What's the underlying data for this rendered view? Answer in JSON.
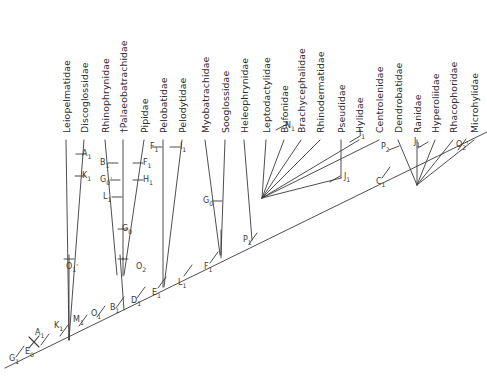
{
  "figure": {
    "type": "phylogenetic-tree",
    "title": ""
  },
  "taxa": [
    {
      "id": "leiopelmatidae",
      "label": "Leiopelmatidae",
      "x": 62,
      "y": 133,
      "tip_x": 66,
      "tip_y": 140
    },
    {
      "id": "discoglossidae",
      "label": "Discoglossidae",
      "x": 80,
      "y": 133,
      "tip_x": 84,
      "tip_y": 140
    },
    {
      "id": "rhinophrynidae",
      "label": "Rhinophrynidae",
      "x": 101,
      "y": 133,
      "tip_x": 105,
      "tip_y": 140
    },
    {
      "id": "palaeobatrachidae",
      "label": "†Palaeobatrachidae",
      "x": 119,
      "y": 133,
      "tip_x": 123,
      "tip_y": 140
    },
    {
      "id": "pipidae",
      "label": "Pipidae",
      "x": 140,
      "y": 133,
      "tip_x": 144,
      "tip_y": 140
    },
    {
      "id": "pelobatidae",
      "label": "Pelobatidae",
      "x": 159,
      "y": 133,
      "tip_x": 163,
      "tip_y": 140
    },
    {
      "id": "pelodytidae",
      "label": "Pelodytidae",
      "x": 178,
      "y": 133,
      "tip_x": 182,
      "tip_y": 140
    },
    {
      "id": "myobatrachidae",
      "label": "Myobatrachidae",
      "x": 201,
      "y": 133,
      "tip_x": 205,
      "tip_y": 140
    },
    {
      "id": "sooglossidae",
      "label": "Sooglossidae",
      "x": 221,
      "y": 133,
      "tip_x": 225,
      "tip_y": 140
    },
    {
      "id": "heleophrynidae",
      "label": "Heleophrynidae",
      "x": 240,
      "y": 133,
      "tip_x": 244,
      "tip_y": 140
    },
    {
      "id": "leptodactylidae",
      "label": "Leptodactylidae",
      "x": 262,
      "y": 133,
      "tip_x": 266,
      "tip_y": 140
    },
    {
      "id": "bufonidae",
      "label": "Bufonidae",
      "x": 280,
      "y": 133,
      "tip_x": 284,
      "tip_y": 140
    },
    {
      "id": "brachycephalidae",
      "label": "Brachycephalidae",
      "x": 297,
      "y": 133,
      "tip_x": 301,
      "tip_y": 140
    },
    {
      "id": "rhinodermatidae",
      "label": "Rhinodermatidae",
      "x": 316,
      "y": 133,
      "tip_x": 320,
      "tip_y": 140
    },
    {
      "id": "pseudidae",
      "label": "Pseudidae",
      "x": 337,
      "y": 133,
      "tip_x": 341,
      "tip_y": 140
    },
    {
      "id": "hylidae",
      "label": "Hylidae",
      "x": 355,
      "y": 133,
      "tip_x": 359,
      "tip_y": 140
    },
    {
      "id": "centrolenidae",
      "label": "Centrolenidae",
      "x": 375,
      "y": 133,
      "tip_x": 379,
      "tip_y": 140
    },
    {
      "id": "dendrobatidae",
      "label": "Dendrobatidae",
      "x": 394,
      "y": 133,
      "tip_x": 398,
      "tip_y": 140
    },
    {
      "id": "ranidae",
      "label": "Ranidae",
      "x": 413,
      "y": 133,
      "tip_x": 417,
      "tip_y": 140
    },
    {
      "id": "hyperoliidae",
      "label": "Hyperoliidae",
      "x": 431,
      "y": 133,
      "tip_x": 435,
      "tip_y": 140
    },
    {
      "id": "rhacophoridae",
      "label": "Rhacophoridae",
      "x": 449,
      "y": 133,
      "tip_x": 453,
      "tip_y": 140
    },
    {
      "id": "microhylidae",
      "label": "Microhylidae",
      "x": 470,
      "y": 133,
      "tip_x": 474,
      "tip_y": 140
    }
  ],
  "node_labels": [
    {
      "id": "A1",
      "letter": "A",
      "sub": "1",
      "prime": "",
      "x": 82,
      "y": 150
    },
    {
      "id": "K1",
      "letter": "K",
      "sub": "1",
      "prime": "",
      "x": 82,
      "y": 172
    },
    {
      "id": "B1",
      "letter": "B",
      "sub": "1",
      "prime": "",
      "x": 100,
      "y": 159
    },
    {
      "id": "G0a",
      "letter": "G",
      "sub": "0",
      "prime": "'",
      "x": 100,
      "y": 176
    },
    {
      "id": "L1",
      "letter": "L",
      "sub": "1",
      "prime": "",
      "x": 103,
      "y": 193
    },
    {
      "id": "F1top",
      "letter": "F",
      "sub": "1",
      "prime": "",
      "x": 150,
      "y": 143
    },
    {
      "id": "F1b",
      "letter": "F",
      "sub": "1",
      "prime": "",
      "x": 143,
      "y": 159
    },
    {
      "id": "H1",
      "letter": "H",
      "sub": "1",
      "prime": "",
      "x": 143,
      "y": 176
    },
    {
      "id": "I1a",
      "letter": "I",
      "sub": "1",
      "prime": "",
      "x": 180,
      "y": 143
    },
    {
      "id": "G0b",
      "letter": "G",
      "sub": "0",
      "prime": "",
      "x": 122,
      "y": 225
    },
    {
      "id": "G0c",
      "letter": "G",
      "sub": "0",
      "prime": "",
      "x": 203,
      "y": 197
    },
    {
      "id": "O1p",
      "letter": "O",
      "sub": "1",
      "prime": "'",
      "x": 66,
      "y": 263
    },
    {
      "id": "O2v",
      "letter": "O",
      "sub": "2",
      "prime": "",
      "x": 136,
      "y": 263
    },
    {
      "id": "N1",
      "letter": "N",
      "sub": "1",
      "prime": "",
      "x": 285,
      "y": 122
    },
    {
      "id": "I1b",
      "letter": "I",
      "sub": "1",
      "prime": "",
      "x": 359,
      "y": 130
    },
    {
      "id": "J1a",
      "letter": "J",
      "sub": "1",
      "prime": "",
      "x": 344,
      "y": 173
    },
    {
      "id": "C1",
      "letter": "C",
      "sub": "1",
      "prime": "",
      "x": 376,
      "y": 178
    },
    {
      "id": "P2",
      "letter": "P",
      "sub": "2",
      "prime": "",
      "x": 381,
      "y": 143
    },
    {
      "id": "J1b",
      "letter": "J",
      "sub": "1",
      "prime": "",
      "x": 414,
      "y": 138
    },
    {
      "id": "O2p",
      "letter": "O",
      "sub": "2",
      "prime": "'",
      "x": 456,
      "y": 141
    },
    {
      "id": "P1",
      "letter": "P",
      "sub": "1",
      "prime": "",
      "x": 243,
      "y": 236
    },
    {
      "id": "F1c",
      "letter": "F",
      "sub": "1",
      "prime": "",
      "x": 204,
      "y": 263
    },
    {
      "id": "L1b",
      "letter": "L",
      "sub": "1",
      "prime": "",
      "x": 178,
      "y": 279
    },
    {
      "id": "E1",
      "letter": "E",
      "sub": "1",
      "prime": "",
      "x": 152,
      "y": 289
    },
    {
      "id": "D1",
      "letter": "D",
      "sub": "1",
      "prime": "",
      "x": 131,
      "y": 297
    },
    {
      "id": "B1b",
      "letter": "B",
      "sub": "1",
      "prime": "",
      "x": 110,
      "y": 304
    },
    {
      "id": "O1b",
      "letter": "O",
      "sub": "1",
      "prime": "",
      "x": 91,
      "y": 310
    },
    {
      "id": "M1",
      "letter": "M",
      "sub": "1",
      "prime": "",
      "x": 73,
      "y": 316
    },
    {
      "id": "K1b",
      "letter": "K",
      "sub": "1",
      "prime": "",
      "x": 54,
      "y": 322
    },
    {
      "id": "A1b",
      "letter": "A",
      "sub": "1",
      "prime": "",
      "x": 35,
      "y": 329
    },
    {
      "id": "E0",
      "letter": "E",
      "sub": "0",
      "prime": "",
      "x": 25,
      "y": 348
    },
    {
      "id": "G1",
      "letter": "G",
      "sub": "1",
      "prime": "",
      "x": 9,
      "y": 355
    }
  ],
  "colors": {
    "line": "#3a3a3a",
    "text": "#2e2e2e",
    "background": "#ffffff"
  }
}
